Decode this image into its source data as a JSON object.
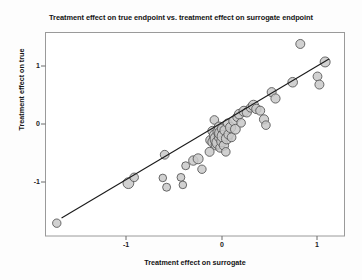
{
  "chart_data": {
    "type": "scatter",
    "title": "Treatment effect on true endpoint vs. treatment effect on surrogate endpoint",
    "xlabel": "Treatment effect on surrogate",
    "ylabel": "Treatment effect on true",
    "xlim": [
      -1.85,
      1.29
    ],
    "ylim": [
      -1.78,
      1.62
    ],
    "xticks": [
      -1,
      0,
      1
    ],
    "xticklabels": [
      "-1",
      "0",
      "1"
    ],
    "yticks": [
      -1,
      0,
      1
    ],
    "yticklabels": [
      "-1",
      "0",
      "1"
    ],
    "grid": false,
    "legend": null,
    "marker": {
      "shape": "circle",
      "fill_color": "#c9c9c9",
      "edge_color": "#595959",
      "opacity": 0.85
    },
    "regression_line": {
      "color": "#1a1a1a",
      "x_start": -1.68,
      "y_start": -1.62,
      "x_end": 1.12,
      "y_end": 1.12,
      "slope": 0.98,
      "intercept": 0.03
    },
    "points": [
      {
        "x": -1.73,
        "y": -1.71,
        "r": 4.2
      },
      {
        "x": -0.98,
        "y": -1.02,
        "r": 5.4
      },
      {
        "x": -0.92,
        "y": -0.92,
        "r": 4.3
      },
      {
        "x": -0.62,
        "y": -0.93,
        "r": 3.8
      },
      {
        "x": -0.58,
        "y": -1.09,
        "r": 4.0
      },
      {
        "x": -0.6,
        "y": -0.53,
        "r": 4.4
      },
      {
        "x": -0.43,
        "y": -0.92,
        "r": 3.9
      },
      {
        "x": -0.41,
        "y": -1.05,
        "r": 3.8
      },
      {
        "x": -0.38,
        "y": -0.72,
        "r": 4.0
      },
      {
        "x": -0.3,
        "y": -0.63,
        "r": 4.7
      },
      {
        "x": -0.25,
        "y": -0.6,
        "r": 5.0
      },
      {
        "x": -0.21,
        "y": -0.78,
        "r": 4.2
      },
      {
        "x": -0.13,
        "y": -0.48,
        "r": 4.5
      },
      {
        "x": -0.12,
        "y": -0.28,
        "r": 4.8
      },
      {
        "x": -0.1,
        "y": -0.12,
        "r": 4.6
      },
      {
        "x": -0.09,
        "y": -0.31,
        "r": 5.6
      },
      {
        "x": -0.08,
        "y": 0.07,
        "r": 4.3
      },
      {
        "x": -0.07,
        "y": -0.2,
        "r": 6.0
      },
      {
        "x": -0.06,
        "y": -0.36,
        "r": 5.1
      },
      {
        "x": -0.05,
        "y": -0.26,
        "r": 7.2
      },
      {
        "x": -0.04,
        "y": -0.13,
        "r": 5.2
      },
      {
        "x": -0.04,
        "y": -0.32,
        "r": 6.3
      },
      {
        "x": -0.03,
        "y": -0.05,
        "r": 4.9
      },
      {
        "x": -0.02,
        "y": -0.22,
        "r": 5.8
      },
      {
        "x": -0.02,
        "y": -0.41,
        "r": 4.4
      },
      {
        "x": -0.01,
        "y": -0.16,
        "r": 6.5
      },
      {
        "x": 0.0,
        "y": -0.3,
        "r": 5.3
      },
      {
        "x": 0.0,
        "y": -0.08,
        "r": 4.6
      },
      {
        "x": 0.01,
        "y": -0.21,
        "r": 5.9
      },
      {
        "x": 0.02,
        "y": -0.37,
        "r": 4.7
      },
      {
        "x": 0.03,
        "y": -0.11,
        "r": 5.0
      },
      {
        "x": 0.04,
        "y": -0.48,
        "r": 4.3
      },
      {
        "x": 0.05,
        "y": -0.25,
        "r": 5.4
      },
      {
        "x": 0.06,
        "y": 0.01,
        "r": 4.5
      },
      {
        "x": 0.07,
        "y": -0.18,
        "r": 4.8
      },
      {
        "x": 0.09,
        "y": -0.06,
        "r": 5.1
      },
      {
        "x": 0.1,
        "y": -0.23,
        "r": 4.4
      },
      {
        "x": 0.12,
        "y": 0.05,
        "r": 4.7
      },
      {
        "x": 0.14,
        "y": -0.09,
        "r": 4.9
      },
      {
        "x": 0.16,
        "y": 0.12,
        "r": 4.5
      },
      {
        "x": 0.18,
        "y": 0.17,
        "r": 4.8
      },
      {
        "x": 0.2,
        "y": 0.02,
        "r": 4.3
      },
      {
        "x": 0.23,
        "y": 0.22,
        "r": 5.0
      },
      {
        "x": 0.26,
        "y": 0.2,
        "r": 4.6
      },
      {
        "x": 0.3,
        "y": 0.28,
        "r": 4.4
      },
      {
        "x": 0.33,
        "y": 0.32,
        "r": 5.2
      },
      {
        "x": 0.36,
        "y": 0.26,
        "r": 4.7
      },
      {
        "x": 0.4,
        "y": 0.23,
        "r": 4.5
      },
      {
        "x": 0.44,
        "y": 0.08,
        "r": 4.6
      },
      {
        "x": 0.46,
        "y": -0.02,
        "r": 4.3
      },
      {
        "x": 0.52,
        "y": 0.55,
        "r": 4.5
      },
      {
        "x": 0.56,
        "y": 0.44,
        "r": 4.6
      },
      {
        "x": 0.74,
        "y": 0.72,
        "r": 4.8
      },
      {
        "x": 0.82,
        "y": 1.38,
        "r": 4.5
      },
      {
        "x": 1.0,
        "y": 0.82,
        "r": 4.4
      },
      {
        "x": 1.02,
        "y": 0.68,
        "r": 4.5
      },
      {
        "x": 1.08,
        "y": 1.07,
        "r": 5.0
      }
    ]
  }
}
